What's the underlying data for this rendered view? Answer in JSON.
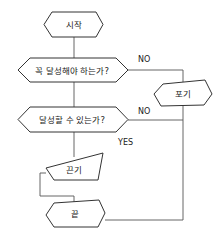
{
  "diagram": {
    "type": "flowchart",
    "colors": {
      "stroke": "#333333",
      "line": "#555555",
      "background": "#ffffff",
      "text": "#222222"
    },
    "nodes": {
      "start": {
        "label": "시작",
        "shape": "hexagon"
      },
      "decision_must": {
        "label": "꼭 달성해야 하는가?",
        "shape": "hexagon-decision"
      },
      "give_up": {
        "label": "포기",
        "shape": "irregular-hexagon"
      },
      "decision_can": {
        "label": "달성할 수 있는가?",
        "shape": "hexagon-decision"
      },
      "persist": {
        "label": "끈기",
        "shape": "trapezoid"
      },
      "end": {
        "label": "끝",
        "shape": "irregular-hexagon"
      }
    },
    "edges": {
      "must_no": {
        "label": "NO"
      },
      "can_no": {
        "label": "NO"
      },
      "can_yes": {
        "label": "YES"
      }
    }
  }
}
